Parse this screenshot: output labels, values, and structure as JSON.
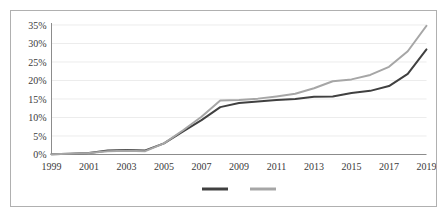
{
  "figure": {
    "border_color": "#b0b0b0",
    "background": "#ffffff"
  },
  "chart_data": {
    "type": "line",
    "title": "",
    "subtitle": "",
    "xlabel": "",
    "ylabel": "",
    "grid": true,
    "legend_position": "bottom",
    "xlim": [
      1999,
      2019
    ],
    "ylim": [
      0,
      35
    ],
    "ytick_labels": [
      "0%",
      "5%",
      "10%",
      "15%",
      "20%",
      "25%",
      "30%",
      "35%"
    ],
    "ytick_values": [
      0,
      5,
      10,
      15,
      20,
      25,
      30,
      35
    ],
    "xtick_labels": [
      "1999",
      "2001",
      "2003",
      "2005",
      "2007",
      "2009",
      "2011",
      "2013",
      "2015",
      "2017",
      "2019"
    ],
    "xtick_values": [
      1999,
      2001,
      2003,
      2005,
      2007,
      2009,
      2011,
      2013,
      2015,
      2017,
      2019
    ],
    "x": [
      1999,
      2000,
      2001,
      2002,
      2003,
      2004,
      2005,
      2006,
      2007,
      2008,
      2009,
      2010,
      2011,
      2012,
      2013,
      2014,
      2015,
      2016,
      2017,
      2018,
      2019
    ],
    "series": [
      {
        "name": "series-dark",
        "color": "#404040",
        "values": [
          0.1,
          0.2,
          0.4,
          1.1,
          1.2,
          1.1,
          3.0,
          6.2,
          9.3,
          12.8,
          13.9,
          14.3,
          14.7,
          15.0,
          15.6,
          15.7,
          16.6,
          17.2,
          18.5,
          21.8,
          28.4
        ]
      },
      {
        "name": "series-light",
        "color": "#a6a6a6",
        "values": [
          0.1,
          0.2,
          0.4,
          0.9,
          1.0,
          0.9,
          3.0,
          6.5,
          10.2,
          14.6,
          14.7,
          15.1,
          15.7,
          16.4,
          17.9,
          19.8,
          20.3,
          21.5,
          23.7,
          27.9,
          34.8
        ]
      }
    ],
    "legend": [
      {
        "label": "",
        "color": "#404040",
        "name": "legend-item-dark"
      },
      {
        "label": "",
        "color": "#a6a6a6",
        "name": "legend-item-light"
      }
    ]
  }
}
